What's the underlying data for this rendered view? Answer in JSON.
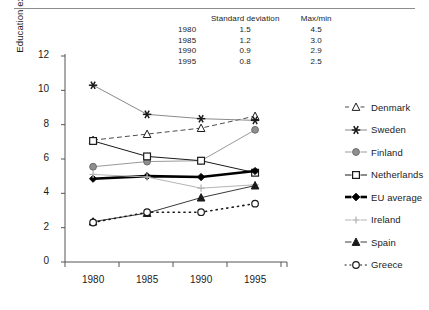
{
  "chart_data": {
    "type": "line",
    "title": "",
    "xlabel": "",
    "ylabel": "Education expenditure as % of GNP, adjusted by share of population 5-24",
    "ylabel_line1": "Education expenditure as % of GNP, adjusted by",
    "ylabel_line2": "share of population 5-24",
    "categories": [
      "1980",
      "1985",
      "1990",
      "1995"
    ],
    "x": [
      1980,
      1985,
      1990,
      1995
    ],
    "ylim": [
      0,
      12
    ],
    "yticks": [
      "0",
      "2",
      "4",
      "6",
      "8",
      "10",
      "12"
    ],
    "ytick_values": [
      0,
      2,
      4,
      6,
      8,
      10,
      12
    ],
    "grid": false,
    "legend_position": "right",
    "series": [
      {
        "name": "Denmark",
        "values": [
          7.1,
          7.45,
          7.8,
          8.5
        ],
        "marker": "open-triangle",
        "line": "dashed",
        "color": "#4d4d4d"
      },
      {
        "name": "Sweden",
        "values": [
          10.3,
          8.6,
          8.35,
          8.25
        ],
        "marker": "asterisk",
        "line": "solid",
        "color": "#8a8a8a"
      },
      {
        "name": "Finland",
        "values": [
          5.55,
          5.85,
          5.9,
          7.7
        ],
        "marker": "filled-circle",
        "line": "solid",
        "color": "#9a9a9a"
      },
      {
        "name": "Netherlands",
        "values": [
          7.05,
          6.15,
          5.9,
          5.2
        ],
        "marker": "open-square",
        "line": "solid",
        "color": "#1a1a1a"
      },
      {
        "name": "EU average",
        "values": [
          4.85,
          5.0,
          4.95,
          5.3
        ],
        "marker": "filled-diamond",
        "line": "thick",
        "color": "#000000"
      },
      {
        "name": "Ireland",
        "values": [
          5.1,
          4.95,
          4.3,
          4.5
        ],
        "marker": "plus",
        "line": "solid",
        "color": "#b5b5b5"
      },
      {
        "name": "Spain",
        "values": [
          2.35,
          2.85,
          3.75,
          4.45
        ],
        "marker": "filled-triangle",
        "line": "solid",
        "color": "#3a3a3a"
      },
      {
        "name": "Greece",
        "values": [
          2.3,
          2.9,
          2.9,
          3.4
        ],
        "marker": "open-circle",
        "line": "dotted",
        "color": "#1a1a1a"
      }
    ],
    "annotation_table": {
      "columns": [
        "",
        "Standard deviation",
        "Max/min"
      ],
      "col_year": "",
      "col_sd": "Standard deviation",
      "col_maxmin": "Max/min",
      "rows": [
        {
          "year": "1980",
          "sd": "1.5",
          "maxmin": "4.5"
        },
        {
          "year": "1985",
          "sd": "1.2",
          "maxmin": "3.0"
        },
        {
          "year": "1990",
          "sd": "0.9",
          "maxmin": "2.9"
        },
        {
          "year": "1995",
          "sd": "0.8",
          "maxmin": "2.5"
        }
      ]
    }
  },
  "legend": {
    "items": [
      {
        "label": "Denmark"
      },
      {
        "label": "Sweden"
      },
      {
        "label": "Finland"
      },
      {
        "label": "Netherlands"
      },
      {
        "label": "EU average"
      },
      {
        "label": "Ireland"
      },
      {
        "label": "Spain"
      },
      {
        "label": "Greece"
      }
    ]
  }
}
